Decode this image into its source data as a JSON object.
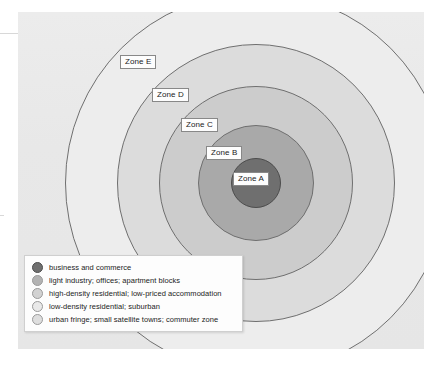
{
  "diagram": {
    "type": "concentric-zone-model",
    "background_color": "#e9e9e9",
    "panel": {
      "x": 18,
      "y": 12,
      "width": 406,
      "height": 337
    },
    "center": {
      "x": 256,
      "y": 183
    },
    "zones": [
      {
        "id": "A",
        "label": "Zone A",
        "radius": 25,
        "fill": "#6f6f6f",
        "stroke": "#4c4c4c",
        "label_x": 233,
        "label_y": 172
      },
      {
        "id": "B",
        "label": "Zone B",
        "radius": 58,
        "fill": "#a9a9a9",
        "stroke": "#6f6f6f",
        "label_x": 206,
        "label_y": 146
      },
      {
        "id": "C",
        "label": "Zone C",
        "radius": 97,
        "fill": "#cccccc",
        "stroke": "#6f6f6f",
        "label_x": 181,
        "label_y": 118
      },
      {
        "id": "D",
        "label": "Zone D",
        "radius": 139,
        "fill": "#dcdcdc",
        "stroke": "#6f6f6f",
        "label_x": 152,
        "label_y": 88
      },
      {
        "id": "E",
        "label": "Zone E",
        "radius": 191,
        "fill": "#ededed",
        "stroke": "#6f6f6f",
        "label_x": 120,
        "label_y": 55
      }
    ]
  },
  "legend": {
    "items": [
      {
        "zone": "A",
        "text": "business and commerce",
        "color": "#6f6f6f"
      },
      {
        "zone": "B",
        "text": "light industry; offices; apartment blocks",
        "color": "#b3b3b3"
      },
      {
        "zone": "C",
        "text": "high-density residential; low-priced accommodation",
        "color": "#d2d2d2"
      },
      {
        "zone": "D",
        "text": "low-density residential; suburban",
        "color": "#e4e4e4"
      },
      {
        "zone": "E",
        "text": "urban fringe; small satellite towns; commuter zone",
        "color": "#dddddd"
      }
    ]
  }
}
